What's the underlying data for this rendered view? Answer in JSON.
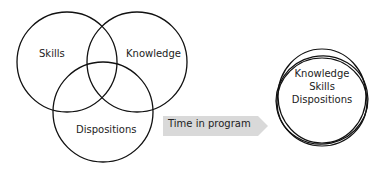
{
  "venn": {
    "skills": "Skills",
    "knowledge": "Knowledge",
    "dispositions": "Dispositions"
  },
  "arrow": {
    "label": "Time in program",
    "color": "#d9d9d9"
  },
  "merged": {
    "line1": "Knowledge",
    "line2": "Skills",
    "line3": "Dispositions"
  }
}
